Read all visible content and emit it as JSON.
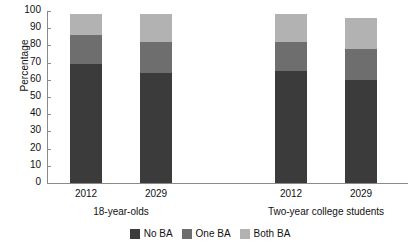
{
  "chart_data": {
    "type": "bar",
    "subtype": "stacked-bar",
    "title": "",
    "xlabel": "",
    "ylabel": "Percentage",
    "ylim": [
      0,
      100
    ],
    "ytick_labels": [
      "0",
      "10",
      "20",
      "30",
      "40",
      "50",
      "60",
      "70",
      "80",
      "90",
      "100"
    ],
    "ytick_values": [
      0,
      10,
      20,
      30,
      40,
      50,
      60,
      70,
      80,
      90,
      100
    ],
    "grid": false,
    "legend_position": "bottom-center",
    "groups": [
      {
        "name": "18-year-olds",
        "categories": [
          "2012",
          "2029"
        ]
      },
      {
        "name": "Two-year college students",
        "categories": [
          "2012",
          "2029"
        ]
      }
    ],
    "categories": [
      "2012",
      "2029",
      "2012",
      "2029"
    ],
    "series": [
      {
        "name": "No BA",
        "color": "#3b3b3b",
        "values": [
          69,
          64,
          65,
          60
        ]
      },
      {
        "name": "One BA",
        "color": "#6e6e6e",
        "values": [
          17,
          18,
          17,
          18
        ]
      },
      {
        "name": "Both BA",
        "color": "#b2b2b2",
        "values": [
          12,
          16,
          16,
          18
        ]
      }
    ],
    "bars": [
      {
        "group": "18-year-olds",
        "category": "2012",
        "total": 98,
        "no_ba": 69,
        "one_ba": 17,
        "both_ba": 12
      },
      {
        "group": "18-year-olds",
        "category": "2029",
        "total": 98,
        "no_ba": 64,
        "one_ba": 18,
        "both_ba": 16
      },
      {
        "group": "Two-year college students",
        "category": "2012",
        "total": 98,
        "no_ba": 65,
        "one_ba": 17,
        "both_ba": 16
      },
      {
        "group": "Two-year college students",
        "category": "2029",
        "total": 96,
        "no_ba": 60,
        "one_ba": 18,
        "both_ba": 18
      }
    ]
  },
  "axis": {
    "y_title": "Percentage"
  },
  "legend": {
    "items": [
      {
        "label": "No BA",
        "color": "#3b3b3b"
      },
      {
        "label": "One BA",
        "color": "#6e6e6e"
      },
      {
        "label": "Both BA",
        "color": "#b2b2b2"
      }
    ]
  },
  "colors": {
    "no_ba": "#3b3b3b",
    "one_ba": "#6e6e6e",
    "both_ba": "#b2b2b2",
    "axis": "#8a8a8a",
    "text": "#111111",
    "background": "#ffffff"
  }
}
